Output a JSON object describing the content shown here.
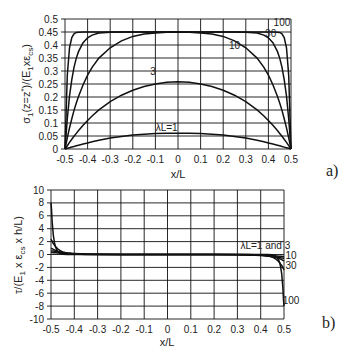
{
  "chart_data": [
    {
      "panel_label": "a)",
      "type": "line",
      "xlabel": "x/L",
      "ylabel": "σ1(z=z*)/(E1xεcs)",
      "xlim": [
        -0.5,
        0.5
      ],
      "ylim": [
        0,
        0.5
      ],
      "grid": true,
      "xticks": [
        "-0.5",
        "-0.4",
        "-0.3",
        "-0.2",
        "-0.1",
        "0",
        "0.1",
        "0.2",
        "0.3",
        "0.4",
        "0.5"
      ],
      "yticks": [
        "0",
        "0.05",
        "0.1",
        "0.15",
        "0.2",
        "0.25",
        "0.3",
        "0.35",
        "0.4",
        "0.45",
        "0.5"
      ],
      "x": [
        -0.5,
        -0.49,
        -0.48,
        -0.47,
        -0.46,
        -0.45,
        -0.44,
        -0.42,
        -0.4,
        -0.38,
        -0.35,
        -0.3,
        -0.25,
        -0.2,
        -0.15,
        -0.1,
        -0.05,
        0,
        0.05,
        0.1,
        0.15,
        0.2,
        0.25,
        0.3,
        0.35,
        0.38,
        0.4,
        0.42,
        0.44,
        0.45,
        0.46,
        0.47,
        0.48,
        0.49,
        0.5
      ],
      "series": [
        {
          "name": "λL=1",
          "label": "λL=1",
          "values": [
            0,
            0.0025,
            0.005,
            0.0074,
            0.0098,
            0.0122,
            0.0145,
            0.0191,
            0.0234,
            0.0275,
            0.0333,
            0.0418,
            0.0485,
            0.0535,
            0.0571,
            0.0592,
            0.0605,
            0.0609,
            0.0605,
            0.0592,
            0.0571,
            0.0535,
            0.0485,
            0.0418,
            0.0333,
            0.0275,
            0.0234,
            0.0191,
            0.0145,
            0.0122,
            0.0098,
            0.0074,
            0.005,
            0.0025,
            0
          ]
        },
        {
          "name": "λL=3",
          "label": "3",
          "values": [
            0,
            0.0128,
            0.0253,
            0.0373,
            0.0489,
            0.0601,
            0.0709,
            0.0912,
            0.1099,
            0.1271,
            0.1502,
            0.1822,
            0.2071,
            0.2262,
            0.2405,
            0.2505,
            0.2565,
            0.2585,
            0.2565,
            0.2505,
            0.2405,
            0.2262,
            0.2071,
            0.1822,
            0.1502,
            0.1271,
            0.1099,
            0.0912,
            0.0709,
            0.0601,
            0.0489,
            0.0373,
            0.0253,
            0.0128,
            0
          ]
        },
        {
          "name": "λL=10",
          "label": "10",
          "values": [
            0,
            0.0429,
            0.0816,
            0.1166,
            0.1483,
            0.177,
            0.2029,
            0.2475,
            0.284,
            0.3139,
            0.3495,
            0.3893,
            0.4159,
            0.433,
            0.4418,
            0.4466,
            0.4489,
            0.4497,
            0.4489,
            0.4466,
            0.4418,
            0.433,
            0.4159,
            0.3893,
            0.3495,
            0.3139,
            0.284,
            0.2475,
            0.2029,
            0.177,
            0.1483,
            0.1166,
            0.0816,
            0.0429,
            0
          ]
        },
        {
          "name": "λL=30",
          "label": "30",
          "values": [
            0,
            0.1166,
            0.2029,
            0.2669,
            0.3139,
            0.3495,
            0.3754,
            0.409,
            0.4276,
            0.4379,
            0.4458,
            0.4494,
            0.45,
            0.45,
            0.45,
            0.45,
            0.45,
            0.45,
            0.45,
            0.45,
            0.45,
            0.45,
            0.45,
            0.4494,
            0.4458,
            0.4379,
            0.4276,
            0.409,
            0.3754,
            0.3495,
            0.3139,
            0.2669,
            0.2029,
            0.1166,
            0
          ]
        },
        {
          "name": "λL=100",
          "label": "100",
          "values": [
            0,
            0.284,
            0.3893,
            0.4284,
            0.443,
            0.4484,
            0.4494,
            0.45,
            0.45,
            0.45,
            0.45,
            0.45,
            0.45,
            0.45,
            0.45,
            0.45,
            0.45,
            0.45,
            0.45,
            0.45,
            0.45,
            0.45,
            0.45,
            0.45,
            0.45,
            0.45,
            0.45,
            0.45,
            0.4494,
            0.4484,
            0.443,
            0.4284,
            0.3893,
            0.284,
            0
          ]
        }
      ],
      "annotations": [
        {
          "text": "λL=1",
          "x": -0.05,
          "y": 0.07
        },
        {
          "text": "3",
          "x": -0.11,
          "y": 0.285
        },
        {
          "text": "10",
          "x": 0.25,
          "y": 0.385
        },
        {
          "text": "30",
          "x": 0.41,
          "y": 0.43
        },
        {
          "text": "100",
          "x": 0.46,
          "y": 0.475
        }
      ]
    },
    {
      "panel_label": "b)",
      "type": "line",
      "xlabel": "x/L",
      "ylabel": "τ/(E1 x εcs x h/L)",
      "xlim": [
        -0.5,
        0.5
      ],
      "ylim": [
        -10,
        10
      ],
      "grid": true,
      "xticks": [
        "-0.5",
        "-0.4",
        "-0.3",
        "-0.2",
        "-0.1",
        "0",
        "0.1",
        "0.2",
        "0.3",
        "0.4",
        "0.5"
      ],
      "yticks": [
        "-10",
        "-8",
        "-6",
        "-4",
        "-2",
        "0",
        "2",
        "4",
        "6",
        "8",
        "10"
      ],
      "x": [
        -0.5,
        -0.498,
        -0.495,
        -0.49,
        -0.485,
        -0.48,
        -0.47,
        -0.46,
        -0.45,
        -0.43,
        -0.4,
        -0.35,
        -0.3,
        -0.2,
        0,
        0.2,
        0.3,
        0.35,
        0.4,
        0.43,
        0.45,
        0.46,
        0.47,
        0.48,
        0.485,
        0.49,
        0.495,
        0.498,
        0.5
      ],
      "series": [
        {
          "name": "λL=1",
          "label": "λL=1 and 3",
          "values": [
            0.3,
            0.3,
            0.29,
            0.28,
            0.27,
            0.26,
            0.24,
            0.22,
            0.2,
            0.16,
            0.12,
            0.07,
            0.04,
            0.01,
            0,
            -0.01,
            -0.04,
            -0.07,
            -0.12,
            -0.16,
            -0.2,
            -0.22,
            -0.24,
            -0.26,
            -0.27,
            -0.28,
            -0.29,
            -0.3,
            -0.3
          ]
        },
        {
          "name": "λL=3",
          "label": "λL=1 and 3",
          "values": [
            0.6,
            0.58,
            0.56,
            0.53,
            0.5,
            0.47,
            0.42,
            0.37,
            0.32,
            0.25,
            0.17,
            0.08,
            0.04,
            0.01,
            0,
            -0.01,
            -0.04,
            -0.08,
            -0.17,
            -0.25,
            -0.32,
            -0.37,
            -0.42,
            -0.47,
            -0.5,
            -0.53,
            -0.56,
            -0.58,
            -0.6
          ]
        },
        {
          "name": "λL=10",
          "label": "10",
          "values": [
            1.0,
            0.95,
            0.9,
            0.8,
            0.72,
            0.65,
            0.52,
            0.42,
            0.34,
            0.22,
            0.1,
            0.03,
            0.01,
            0,
            0,
            0,
            -0.01,
            -0.03,
            -0.1,
            -0.22,
            -0.34,
            -0.42,
            -0.52,
            -0.65,
            -0.72,
            -0.8,
            -0.9,
            -0.95,
            -1.0
          ]
        },
        {
          "name": "λL=30",
          "label": "30",
          "values": [
            2.4,
            2.25,
            2.05,
            1.7,
            1.45,
            1.2,
            0.85,
            0.6,
            0.4,
            0.2,
            0.06,
            0.01,
            0,
            0,
            0,
            0,
            0,
            -0.01,
            -0.06,
            -0.2,
            -0.4,
            -0.6,
            -0.85,
            -1.2,
            -1.45,
            -1.7,
            -2.05,
            -2.25,
            -2.4
          ]
        },
        {
          "name": "λL=100",
          "label": "100",
          "values": [
            8.0,
            7.0,
            5.0,
            3.0,
            1.8,
            1.1,
            0.4,
            0.15,
            0.05,
            0.01,
            0,
            0,
            0,
            0,
            0,
            0,
            0,
            0,
            0,
            -0.01,
            -0.05,
            -0.15,
            -0.4,
            -1.1,
            -1.8,
            -3.0,
            -5.0,
            -7.0,
            -8.0
          ]
        }
      ],
      "annotations": [
        {
          "text": "λL=1 and 3",
          "x": 0.42,
          "y": 0.9
        },
        {
          "text": "10",
          "x": 0.53,
          "y": -0.7
        },
        {
          "text": "30",
          "x": 0.53,
          "y": -2.2
        },
        {
          "text": "100",
          "x": 0.53,
          "y": -7.6
        }
      ]
    }
  ]
}
